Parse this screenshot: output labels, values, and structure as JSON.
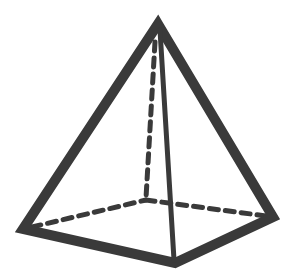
{
  "diagram": {
    "type": "square-pyramid",
    "background": "#ffffff",
    "stroke_color": "#3a3a3a",
    "vertices": {
      "apex": [
        158,
        22
      ],
      "base_left": [
        22,
        230
      ],
      "base_front": [
        175,
        265
      ],
      "base_right": [
        275,
        217
      ],
      "base_back_hidden": [
        146,
        200
      ]
    },
    "solid_edges": [
      {
        "from": "apex",
        "to": "base_left"
      },
      {
        "from": "apex",
        "to": "base_right"
      },
      {
        "from": "apex",
        "to": "base_front"
      },
      {
        "from": "base_left",
        "to": "base_front"
      },
      {
        "from": "base_front",
        "to": "base_right"
      }
    ],
    "hidden_edges": [
      {
        "from": "apex",
        "to": "base_back_hidden"
      },
      {
        "from": "base_left",
        "to": "base_back_hidden"
      },
      {
        "from": "base_back_hidden",
        "to": "base_right"
      }
    ]
  }
}
